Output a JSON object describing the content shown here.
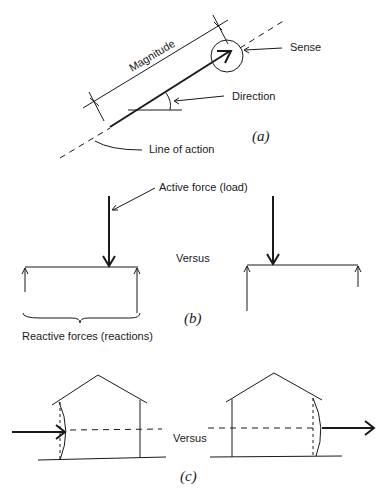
{
  "figure": {
    "panel_a": {
      "labels": {
        "magnitude": "Magnitude",
        "sense": "Sense",
        "direction": "Direction",
        "line_of_action": "Line of action"
      },
      "caption": "(a)"
    },
    "panel_b": {
      "labels": {
        "active_force": "Active force (load)",
        "versus": "Versus",
        "reactive_forces": "Reactive forces (reactions)"
      },
      "caption": "(b)"
    },
    "panel_c": {
      "labels": {
        "versus": "Versus"
      },
      "caption": "(c)"
    }
  },
  "colors": {
    "ink": "#1a1a1a",
    "background": "#ffffff"
  }
}
